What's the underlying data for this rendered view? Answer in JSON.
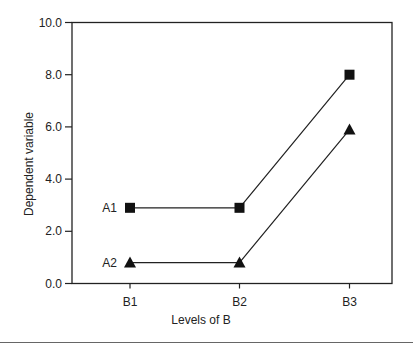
{
  "chart_data": {
    "type": "line",
    "title": "",
    "xlabel": "Levels of B",
    "ylabel": "Dependent variable",
    "categories": [
      "B1",
      "B2",
      "B3"
    ],
    "ylim": [
      0,
      10
    ],
    "yticks": [
      "0.0",
      "2.0",
      "4.0",
      "6.0",
      "8.0",
      "10.0"
    ],
    "grid": false,
    "legend_position": "inline labels at left of series",
    "series": [
      {
        "name": "A1",
        "marker": "square",
        "values": [
          2.9,
          2.9,
          8.0
        ]
      },
      {
        "name": "A2",
        "marker": "triangle",
        "values": [
          0.8,
          0.8,
          5.9
        ]
      }
    ]
  },
  "colors": {
    "line": "#222222",
    "marker": "#111111",
    "axis": "#222222",
    "rule": "#666666"
  }
}
